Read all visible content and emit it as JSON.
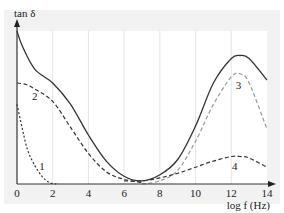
{
  "chart_data": {
    "type": "line",
    "title": "",
    "xlabel": "log f (Hz)",
    "ylabel": "tan δ",
    "xlim": [
      0,
      14
    ],
    "ylim": [
      0,
      1
    ],
    "grid": {
      "vertical": true,
      "horizontal": false
    },
    "legend": "curves labeled inline: 1, 2, 3, 4",
    "x_ticks": [
      "0",
      "2",
      "4",
      "6",
      "8",
      "10",
      "12",
      "14"
    ],
    "colors": {
      "panel": "#f2f2f2",
      "plot_bg": "#ffffff",
      "grid": "#e6e6e6",
      "axis": "#333333",
      "solid": "#333333",
      "dash_dark": "#333333",
      "dash_light": "#999999"
    },
    "series": [
      {
        "name": "total",
        "style": "solid",
        "color": "#333333",
        "x": [
          0,
          0.3,
          1,
          2,
          3,
          4,
          5,
          6,
          7,
          8,
          9,
          10,
          11,
          12,
          12.5,
          13,
          14
        ],
        "y": [
          1.0,
          0.9,
          0.75,
          0.66,
          0.52,
          0.32,
          0.15,
          0.05,
          0.02,
          0.06,
          0.16,
          0.38,
          0.66,
          0.82,
          0.84,
          0.82,
          0.68
        ]
      },
      {
        "name": "1",
        "label": "1",
        "style": "dotted",
        "color": "#333333",
        "x": [
          0,
          0.3,
          0.6,
          1,
          1.4,
          1.8,
          2.2
        ],
        "y": [
          0.52,
          0.36,
          0.22,
          0.12,
          0.05,
          0.01,
          0.0
        ]
      },
      {
        "name": "2",
        "label": "2",
        "style": "dashed",
        "color": "#333333",
        "x": [
          0,
          0.5,
          1,
          2,
          3,
          4,
          5,
          6,
          7
        ],
        "y": [
          0.66,
          0.65,
          0.62,
          0.54,
          0.37,
          0.2,
          0.08,
          0.03,
          0.01
        ]
      },
      {
        "name": "3",
        "label": "3",
        "style": "dashed",
        "color": "#999999",
        "x": [
          7,
          8,
          9,
          10,
          11,
          12,
          12.5,
          13,
          14
        ],
        "y": [
          0.0,
          0.02,
          0.09,
          0.28,
          0.52,
          0.7,
          0.72,
          0.66,
          0.36
        ]
      },
      {
        "name": "4",
        "label": "4",
        "style": "dashed",
        "color": "#333333",
        "x": [
          6,
          7,
          8,
          9,
          10,
          11,
          12,
          12.5,
          13,
          14
        ],
        "y": [
          0.02,
          0.02,
          0.04,
          0.07,
          0.11,
          0.15,
          0.18,
          0.18,
          0.17,
          0.11
        ]
      }
    ]
  }
}
